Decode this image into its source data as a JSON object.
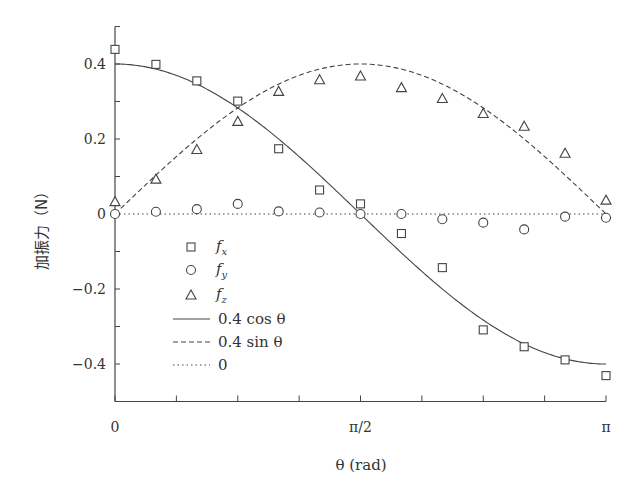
{
  "chart_data": {
    "type": "scatter",
    "title": "",
    "xlabel": "θ (rad)",
    "ylabel": "加振力（N）",
    "xlim": [
      0,
      3.14159
    ],
    "ylim": [
      -0.5,
      0.5
    ],
    "grid": false,
    "legend_position": "inside lower-left",
    "x_ticks": [
      {
        "value": 0,
        "label": "0"
      },
      {
        "value": 1.5708,
        "label": "π/2"
      },
      {
        "value": 3.14159,
        "label": "π"
      }
    ],
    "x_minor_ticks_per_major": 4,
    "y_ticks": [
      {
        "value": 0.4,
        "label": "0.4"
      },
      {
        "value": 0.2,
        "label": "0.2"
      },
      {
        "value": 0,
        "label": "0"
      },
      {
        "value": -0.2,
        "label": "−0.2"
      },
      {
        "value": -0.4,
        "label": "−0.4"
      }
    ],
    "x": [
      0,
      0.2618,
      0.5236,
      0.7854,
      1.0472,
      1.309,
      1.5708,
      1.8326,
      2.0944,
      2.3562,
      2.618,
      2.8798,
      3.1416
    ],
    "x_labels_fraction_of_pi": [
      "0",
      "π/12",
      "π/6",
      "π/4",
      "π/3",
      "5π/12",
      "π/2",
      "7π/12",
      "2π/3",
      "3π/4",
      "5π/6",
      "11π/12",
      "π"
    ],
    "series": [
      {
        "name": "f_x",
        "label_main": "f",
        "label_sub": "x",
        "marker": "square",
        "values": [
          0.439,
          0.399,
          0.355,
          0.301,
          0.174,
          0.064,
          0.027,
          -0.052,
          -0.143,
          -0.309,
          -0.354,
          -0.389,
          -0.431
        ]
      },
      {
        "name": "f_y",
        "label_main": "f",
        "label_sub": "y",
        "marker": "circle",
        "values": [
          0.0,
          0.006,
          0.013,
          0.027,
          0.007,
          0.004,
          0.0,
          0.0,
          -0.014,
          -0.023,
          -0.041,
          -0.007,
          -0.01
        ]
      },
      {
        "name": "f_z",
        "label_main": "f",
        "label_sub": "z",
        "marker": "triangle",
        "values": [
          0.033,
          0.093,
          0.172,
          0.247,
          0.327,
          0.358,
          0.368,
          0.337,
          0.308,
          0.268,
          0.234,
          0.162,
          0.037
        ]
      }
    ],
    "reference_lines": [
      {
        "name": "0.4 cos θ",
        "label": "0.4 cos θ",
        "style": "solid",
        "function": "0.4*cos(theta)"
      },
      {
        "name": "0.4 sin θ",
        "label": "0.4 sin θ",
        "style": "dashed",
        "function": "0.4*sin(theta)"
      },
      {
        "name": "0",
        "label": "0",
        "style": "dotted",
        "function": "0"
      }
    ]
  },
  "legend": [
    {
      "kind": "marker",
      "marker": "square",
      "main": "f",
      "sub": "x"
    },
    {
      "kind": "marker",
      "marker": "circle",
      "main": "f",
      "sub": "y"
    },
    {
      "kind": "marker",
      "marker": "triangle",
      "main": "f",
      "sub": "z"
    },
    {
      "kind": "line",
      "style": "solid",
      "text": "0.4 cos θ"
    },
    {
      "kind": "line",
      "style": "dashed",
      "text": "0.4 sin θ"
    },
    {
      "kind": "line",
      "style": "dotted",
      "text": "0"
    }
  ],
  "colors": {
    "ink": "#444444",
    "background": "#ffffff"
  }
}
